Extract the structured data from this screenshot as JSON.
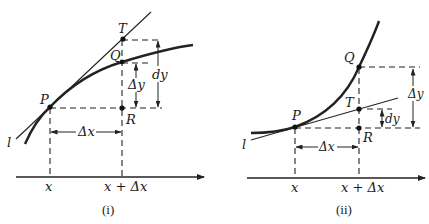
{
  "figures": [
    {
      "id": "i",
      "caption": "(i)",
      "description": "Concave-down curve: tangent line lies above the curve, so dy > Δy",
      "labels": {
        "tangent_line": "l",
        "point_P": "P",
        "point_Q": "Q",
        "point_T": "T",
        "point_R": "R",
        "delta_x": "Δx",
        "delta_y": "Δy",
        "dy": "dy",
        "x_tick_1": "x",
        "x_tick_2": "x + Δx"
      }
    },
    {
      "id": "ii",
      "caption": "(ii)",
      "description": "Concave-up curve: tangent line lies below the curve, so dy < Δy",
      "labels": {
        "tangent_line": "l",
        "point_P": "P",
        "point_Q": "Q",
        "point_T": "T",
        "point_R": "R",
        "delta_x": "Δx",
        "delta_y": "Δy",
        "dy": "dy",
        "x_tick_1": "x",
        "x_tick_2": "x + Δx"
      }
    }
  ],
  "colors": {
    "ink": "#222222",
    "background": "#ffffff"
  }
}
